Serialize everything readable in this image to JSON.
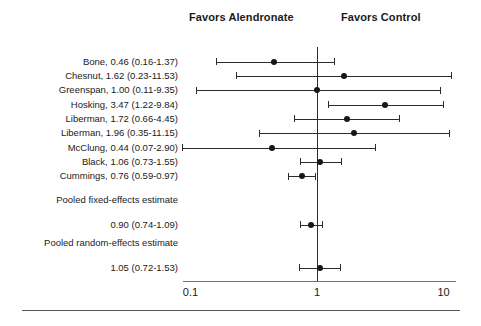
{
  "header": {
    "left_label": "Favors Alendronate",
    "right_label": "Favors Control"
  },
  "axis": {
    "ticks": [
      {
        "label": "0.1",
        "value": 0.1
      },
      {
        "label": "1",
        "value": 1
      },
      {
        "label": "10",
        "value": 10
      }
    ],
    "scale": "log10",
    "null_value": 1,
    "xlim": [
      0.1,
      10
    ]
  },
  "colors": {
    "marker": "#171717",
    "line": "#2b2b2b",
    "axis": "#707070",
    "rule": "#555555",
    "text": "#1a1a1a",
    "background": "#ffffff"
  },
  "chart_data": {
    "type": "forest",
    "title": "",
    "xlabel": "",
    "ylabel": "",
    "effect_measure": "Relative risk",
    "xlim": [
      0.1,
      10
    ],
    "xscale": "log",
    "xticks": [
      0.1,
      1,
      10
    ],
    "xticklabels": [
      "0.1",
      "1",
      "10"
    ],
    "null_line": 1,
    "grid": false,
    "legend": false,
    "left_header": "Favors Alendronate",
    "right_header": "Favors Control",
    "studies": [
      {
        "name": "Bone",
        "label": "Bone, 0.46 (0.16-1.37)",
        "estimate": 0.46,
        "lower": 0.16,
        "upper": 1.37
      },
      {
        "name": "Chesnut",
        "label": "Chesnut, 1.62 (0.23-11.53)",
        "estimate": 1.62,
        "lower": 0.23,
        "upper": 11.53
      },
      {
        "name": "Greenspan",
        "label": "Greenspan, 1.00 (0.11-9.35)",
        "estimate": 1.0,
        "lower": 0.11,
        "upper": 9.35
      },
      {
        "name": "Hosking",
        "label": "Hosking, 3.47 (1.22-9.84)",
        "estimate": 3.47,
        "lower": 1.22,
        "upper": 9.84
      },
      {
        "name": "Liberman",
        "label": "Liberman, 1.72 (0.66-4.45)",
        "estimate": 1.72,
        "lower": 0.66,
        "upper": 4.45
      },
      {
        "name": "Liberman",
        "label": "Liberman, 1.96 (0.35-11.15)",
        "estimate": 1.96,
        "lower": 0.35,
        "upper": 11.15
      },
      {
        "name": "McClung",
        "label": "McClung, 0.44 (0.07-2.90)",
        "estimate": 0.44,
        "lower": 0.07,
        "upper": 2.9
      },
      {
        "name": "Black",
        "label": "Black, 1.06 (0.73-1.55)",
        "estimate": 1.06,
        "lower": 0.73,
        "upper": 1.55
      },
      {
        "name": "Cummings",
        "label": "Cummings, 0.76 (0.59-0.97)",
        "estimate": 0.76,
        "lower": 0.59,
        "upper": 0.97
      }
    ],
    "pooled": [
      {
        "id": "fixed",
        "title": "Pooled fixed-effects estimate",
        "label": "0.90 (0.74-1.09)",
        "estimate": 0.9,
        "lower": 0.74,
        "upper": 1.09
      },
      {
        "id": "random",
        "title": "Pooled random-effects estimate",
        "label": "1.05 (0.72-1.53)",
        "estimate": 1.05,
        "lower": 0.72,
        "upper": 1.53
      }
    ]
  }
}
